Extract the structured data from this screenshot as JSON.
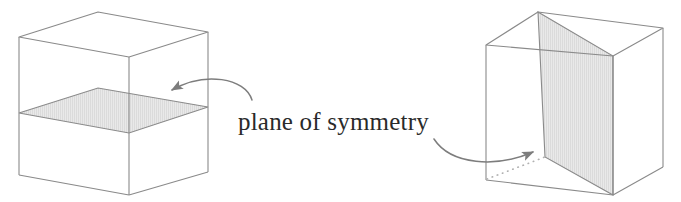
{
  "figure": {
    "kind": "geometry-diagram",
    "caption": "plane of symmetry",
    "background_color": "#ffffff",
    "line_color": "#8a8a8a",
    "plane_fill_color": "#e8e8e8",
    "plane_hatch_color": "#d2d2d2",
    "text_color": "#2a2a2a",
    "arrow_color": "#7d7d7d",
    "dashed_color": "#b0b0b0"
  },
  "shapes": {
    "left_cube": {
      "label": "cube-with-horizontal-plane",
      "description": "cube cut by a horizontal mid-height plane of symmetry",
      "vertices": {
        "top_left": [
          19,
          37
        ],
        "top_back": [
          98,
          12
        ],
        "top_right": [
          208,
          32
        ],
        "top_front": [
          129,
          57
        ],
        "bottom_left": [
          19,
          175
        ],
        "bottom_front": [
          129,
          195
        ],
        "bottom_right": [
          208,
          172
        ]
      },
      "plane": {
        "orientation": "horizontal",
        "points": [
          [
            19,
            113
          ],
          [
            98,
            88
          ],
          [
            208,
            107
          ],
          [
            129,
            133
          ]
        ]
      }
    },
    "right_cube": {
      "label": "cube-with-diagonal-plane",
      "description": "cube cut by a vertical diagonal plane of symmetry",
      "vertices": {
        "top_left": [
          486,
          45
        ],
        "top_back": [
          538,
          12
        ],
        "top_right": [
          663,
          28
        ],
        "top_front": [
          613,
          56
        ],
        "bottom_left": [
          486,
          180
        ],
        "bottom_front": [
          613,
          195
        ],
        "bottom_right": [
          663,
          167
        ]
      },
      "plane": {
        "orientation": "vertical-diagonal",
        "points": [
          [
            538,
            12
          ],
          [
            613,
            56
          ],
          [
            613,
            195
          ],
          [
            545,
            157
          ]
        ]
      },
      "hidden_edge": {
        "style": "dotted",
        "from": [
          487,
          179
        ],
        "to": [
          545,
          157
        ]
      }
    }
  },
  "annotations": {
    "caption": {
      "text": "plane of symmetry",
      "x": 238,
      "y": 130,
      "font_size": 25
    },
    "left_arrow": {
      "name": "arrow-to-horizontal-plane",
      "points_to": "left cube horizontal plane",
      "tail": [
        252,
        100
      ],
      "head": [
        168,
        95
      ]
    },
    "right_arrow": {
      "name": "arrow-to-diagonal-plane",
      "points_to": "right cube diagonal plane",
      "tail": [
        434,
        138
      ],
      "head": [
        538,
        148
      ]
    }
  }
}
